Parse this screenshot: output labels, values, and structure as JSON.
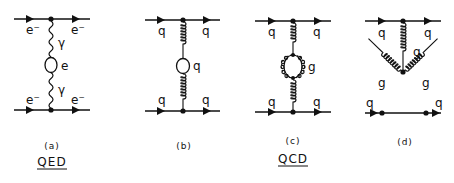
{
  "figure": {
    "diagrams": [
      {
        "id": "a",
        "caption": "(a)",
        "top_in": "e⁻",
        "top_out": "e⁻",
        "bottom_in": "e⁻",
        "bottom_out": "e⁻",
        "upper_propagator": "γ",
        "loop": "e",
        "lower_propagator": "γ"
      },
      {
        "id": "b",
        "caption": "(b)",
        "top_in": "q",
        "top_out": "q",
        "bottom_in": "q",
        "bottom_out": "q",
        "loop": "q"
      },
      {
        "id": "c",
        "caption": "(c)",
        "top_in": "q",
        "top_out": "q",
        "bottom_in": "q",
        "bottom_out": "q",
        "loop": "g"
      },
      {
        "id": "d",
        "caption": "(d)",
        "top_in": "q",
        "top_out": "q",
        "vertical_gluon": "g",
        "left_gluon": "g",
        "right_gluon": "g",
        "bottom_in": "q",
        "bottom_out": "q"
      }
    ],
    "theories": {
      "qed": "QED",
      "qcd": "QCD"
    },
    "colors": {
      "ink": "#111111",
      "background": "#ffffff"
    }
  }
}
